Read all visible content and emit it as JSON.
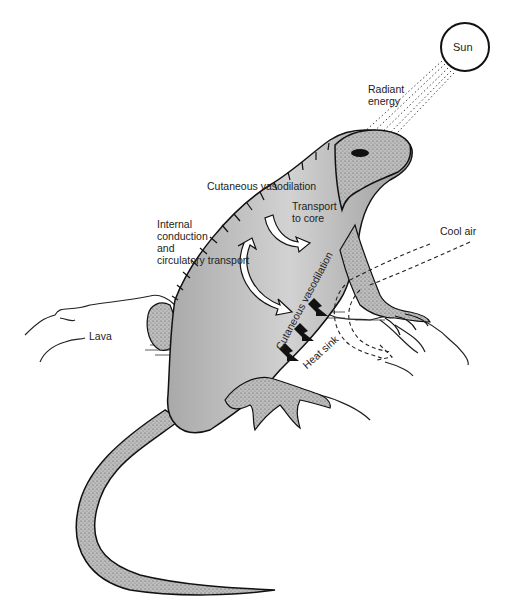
{
  "diagram": {
    "labels": {
      "sun": "Sun",
      "radiant_energy": "Radiant\nenergy",
      "cutaneous_vasodilation_top": "Cutaneous vasodilation",
      "transport_to_core": "Transport\nto core",
      "internal_conduction": "Internal\nconduction\nand\ncirculatory transport",
      "cool_air": "Cool air",
      "lava": "Lava",
      "cutaneous_vasodilation_belly": "Cutaneous vasodilation",
      "heat_sink": "Heat sink"
    },
    "colors": {
      "background": "#ffffff",
      "ink": "#1a1a1a",
      "body_fill": "#c9c9c9",
      "body_shade": "#9a9a9a"
    }
  }
}
